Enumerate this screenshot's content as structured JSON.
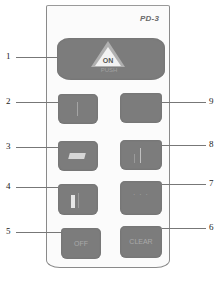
{
  "diagram": {
    "model_label": "PD-3",
    "keys": [
      {
        "id": 1,
        "label_on": "ON",
        "label_sub": "PUSH",
        "icon": "on-triangle-icon"
      },
      {
        "id": 2,
        "label": "",
        "icon": "vertical-line-icon"
      },
      {
        "id": 3,
        "label": "",
        "icon": "block-icon"
      },
      {
        "id": 4,
        "label": "",
        "icon": "bar-icon"
      },
      {
        "id": 5,
        "label": "OFF",
        "icon": ""
      },
      {
        "id": 6,
        "label": "CLEAR",
        "icon": ""
      },
      {
        "id": 7,
        "label": "",
        "icon": "dots-icon"
      },
      {
        "id": 8,
        "label": "",
        "icon": "arrow-up-icon"
      },
      {
        "id": 9,
        "label": "",
        "icon": "blank-icon"
      }
    ],
    "callouts": {
      "left": [
        "1",
        "2",
        "3",
        "4",
        "5"
      ],
      "right": [
        "9",
        "8",
        "7",
        "6"
      ]
    }
  }
}
